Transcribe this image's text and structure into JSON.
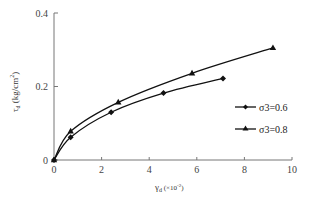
{
  "chart_data": {
    "type": "line",
    "title": "",
    "xlabel": "γd (×10⁻²)",
    "ylabel": "τd (kg/cm²)",
    "xlim": [
      0,
      10
    ],
    "ylim": [
      0,
      0.4
    ],
    "x_ticks": [
      "0",
      "2",
      "4",
      "6",
      "8",
      "10"
    ],
    "y_ticks": [
      "0",
      "0.2",
      "0.4"
    ],
    "grid": false,
    "legend_position": "right-center",
    "series": [
      {
        "name": "σ3=0.6",
        "marker": "diamond",
        "x": [
          0,
          0.7,
          2.4,
          4.6,
          7.1
        ],
        "y": [
          0,
          0.062,
          0.13,
          0.182,
          0.222
        ]
      },
      {
        "name": "σ3=0.8",
        "marker": "triangle",
        "x": [
          0,
          0.7,
          2.7,
          5.8,
          9.2
        ],
        "y": [
          0,
          0.078,
          0.157,
          0.236,
          0.305
        ]
      }
    ]
  },
  "axes": {
    "x_title_main": "γ",
    "x_title_sub": "d",
    "x_title_unit": " (×10",
    "x_title_exp": "-2",
    "x_title_close": ")",
    "y_title_main": "τ",
    "y_title_sub": "d",
    "y_title_unit": " (kg/cm",
    "y_title_exp": "2",
    "y_title_close": ")"
  },
  "legend": [
    {
      "label": "σ3=0.6",
      "marker": "diamond"
    },
    {
      "label": "σ3=0.8",
      "marker": "triangle"
    }
  ]
}
